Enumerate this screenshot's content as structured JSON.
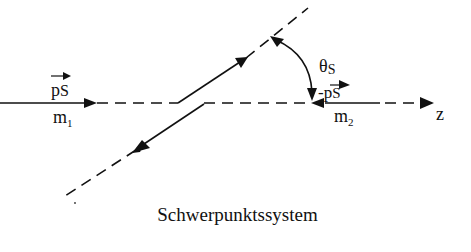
{
  "diagram": {
    "caption": "Schwerpunktssystem",
    "axis_label": "z",
    "particle1": {
      "momentum_label": "p",
      "momentum_sub": "S",
      "mass_label": "m",
      "mass_sub": "1"
    },
    "particle2": {
      "momentum_label": "-p",
      "momentum_sub": "S",
      "mass_label": "m",
      "mass_sub": "2"
    },
    "angle_label": "θ",
    "angle_sub": "S",
    "colors": {
      "line": "#111111",
      "background": "#ffffff"
    }
  }
}
